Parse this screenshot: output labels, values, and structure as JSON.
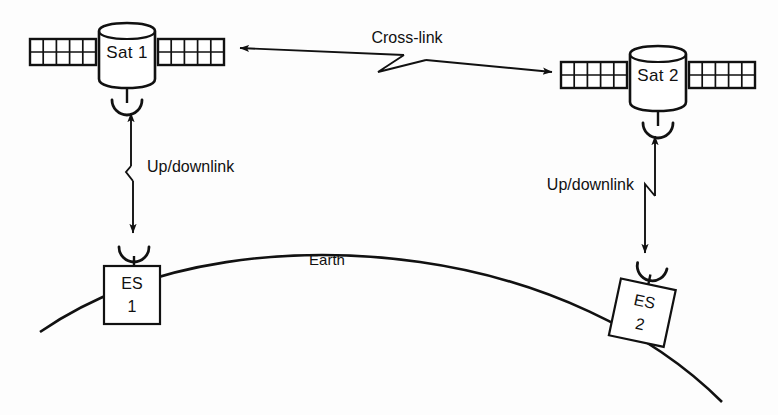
{
  "diagram": {
    "background_color": "#fdfdfd",
    "line_color": "#111111"
  },
  "satellites": [
    {
      "id": "sat-1",
      "label": "Sat 1",
      "solar_panel_rows": 2,
      "solar_panel_columns": 5
    },
    {
      "id": "sat-2",
      "label": "Sat 2",
      "solar_panel_rows": 2,
      "solar_panel_columns": 5
    }
  ],
  "ground_stations": [
    {
      "id": "es-1",
      "label_line1": "ES",
      "label_line2": "1"
    },
    {
      "id": "es-2",
      "label_line1": "ES",
      "label_line2": "2"
    }
  ],
  "links": [
    {
      "id": "cross-link",
      "label": "Cross-link",
      "direction": "bidirectional",
      "from": "Sat 1",
      "to": "Sat 2"
    },
    {
      "id": "uplink-downlink-left",
      "label": "Up/downlink",
      "direction": "bidirectional",
      "from": "ES 1",
      "to": "Sat 1"
    },
    {
      "id": "uplink-downlink-right",
      "label": "Up/downlink",
      "direction": "bidirectional",
      "from": "ES 2",
      "to": "Sat 2"
    }
  ],
  "earth": {
    "label": "Earth"
  }
}
